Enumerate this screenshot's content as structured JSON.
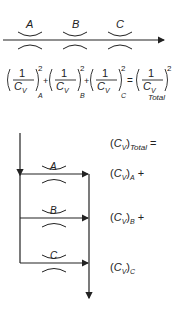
{
  "series_diagram": {
    "orifices": [
      {
        "label": "A"
      },
      {
        "label": "B"
      },
      {
        "label": "C"
      }
    ]
  },
  "series_equation": {
    "terms": [
      {
        "numerator": "1",
        "denominator": "C",
        "den_sub": "V",
        "subscript": "A",
        "exponent": "2",
        "op": "+"
      },
      {
        "numerator": "1",
        "denominator": "C",
        "den_sub": "V",
        "subscript": "B",
        "exponent": "2",
        "op": "+"
      },
      {
        "numerator": "1",
        "denominator": "C",
        "den_sub": "V",
        "subscript": "C",
        "exponent": "2",
        "op": "="
      },
      {
        "numerator": "1",
        "denominator": "C",
        "den_sub": "V",
        "subscript": "Total",
        "exponent": "2",
        "op": ""
      }
    ]
  },
  "parallel_diagram": {
    "branches": [
      {
        "label": "A"
      },
      {
        "label": "B"
      },
      {
        "label": "C"
      }
    ],
    "equation": [
      {
        "base": "C",
        "base_sub": "V",
        "subscript": "Total",
        "op": "="
      },
      {
        "base": "C",
        "base_sub": "V",
        "subscript": "A",
        "op": "+"
      },
      {
        "base": "C",
        "base_sub": "V",
        "subscript": "B",
        "op": "+"
      },
      {
        "base": "C",
        "base_sub": "V",
        "subscript": "C",
        "op": ""
      }
    ]
  }
}
